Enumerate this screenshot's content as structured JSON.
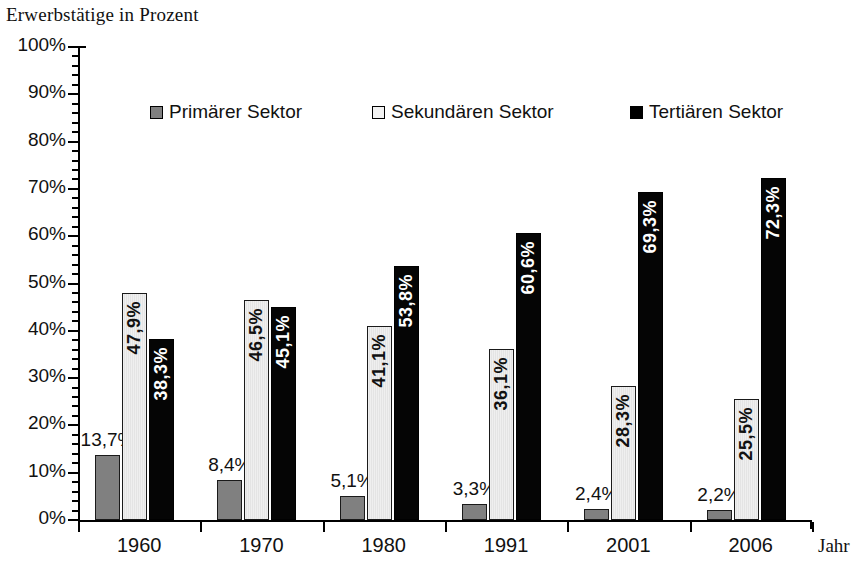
{
  "chart_data": {
    "type": "bar",
    "title": "Erwerbstätige in Prozent",
    "xlabel": "Jahr",
    "ylabel": "",
    "ylim": [
      0,
      100
    ],
    "ytick_labels": [
      "100%",
      "90%",
      "80%",
      "70%",
      "60%",
      "50%",
      "40%",
      "30%",
      "20%",
      "10%",
      "0%"
    ],
    "ytick_values": [
      100,
      90,
      80,
      70,
      60,
      50,
      40,
      30,
      20,
      10,
      0
    ],
    "grid": false,
    "legend_position": "top-inside",
    "categories": [
      "1960",
      "1970",
      "1980",
      "1991",
      "2001",
      "2006"
    ],
    "series": [
      {
        "name": "Primärer Sektor",
        "color": "#808080",
        "values": [
          13.7,
          8.4,
          5.1,
          3.3,
          2.4,
          2.2
        ],
        "labels": [
          "13,7%",
          "8,4%",
          "5,1%",
          "3,3%",
          "2,4%",
          "2,2%"
        ],
        "label_placement": "outside"
      },
      {
        "name": "Sekundären Sektor",
        "color": "#f2f2f2",
        "values": [
          47.9,
          46.5,
          41.1,
          36.1,
          28.3,
          25.5
        ],
        "labels": [
          "47,9%",
          "46,5%",
          "41,1%",
          "36,1%",
          "28,3%",
          "25,5%"
        ],
        "label_placement": "inside"
      },
      {
        "name": "Tertiären Sektor",
        "color": "#000000",
        "values": [
          38.3,
          45.1,
          53.8,
          60.6,
          69.3,
          72.3
        ],
        "labels": [
          "38,3%",
          "45,1%",
          "53,8%",
          "60,6%",
          "69,3%",
          "72,3%"
        ],
        "label_placement": "inside"
      }
    ]
  },
  "legend": {
    "items": [
      {
        "label": "Primärer Sektor",
        "swatch": "primary"
      },
      {
        "label": "Sekundären Sektor",
        "swatch": "secondary"
      },
      {
        "label": "Tertiären Sektor",
        "swatch": "tertiary"
      }
    ]
  }
}
